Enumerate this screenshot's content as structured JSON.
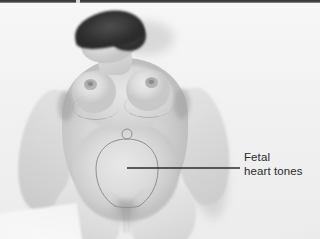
{
  "figure": {
    "kind": "clinical-photograph",
    "modality": "grayscale photograph with line-drawing annotation overlay",
    "background_color": "#f2f2f2",
    "top_band_color": "#3a3a3a"
  },
  "annotations": {
    "callout": {
      "label_line1": "Fetal",
      "label_line2": "heart tones",
      "text_color": "#2b2b2b",
      "leader_line": {
        "name": "leader-line",
        "color": "#2b2b2b",
        "x1": 127,
        "y1": 168,
        "x2": 240,
        "y2": 168,
        "thickness_px": 1.6
      },
      "target_point": {
        "x": 127,
        "y": 168
      }
    },
    "uterine_outline": {
      "name": "fundal-outline",
      "shape": "teardrop / inverted-pear outline of the gravid uterus",
      "stroke_color": "#8f8f8f",
      "center_x": 127,
      "top_y": 139,
      "bottom_y": 206,
      "width": 62
    },
    "umbilicus": {
      "name": "umbilicus-mark",
      "shape": "small circle above the fundal outline",
      "x": 127,
      "y": 134,
      "radius": 5
    }
  }
}
